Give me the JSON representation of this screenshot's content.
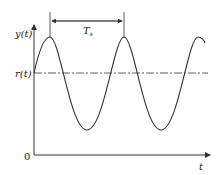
{
  "diagram": {
    "y_axis_label": "y(t)",
    "ref_label": "r(t)",
    "origin_label": "0",
    "x_axis_label": "t",
    "period_label": "T",
    "period_subscript": "s",
    "colors": {
      "line": "#333333"
    }
  }
}
